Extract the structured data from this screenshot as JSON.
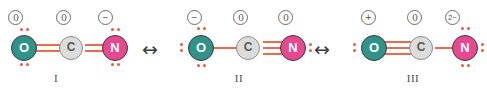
{
  "diagram": {
    "arrow_glyph": "↔",
    "structures": [
      {
        "label": "I",
        "atoms": [
          {
            "symbol": "O",
            "element": "oxygen",
            "formal_charge": "0"
          },
          {
            "symbol": "C",
            "element": "carbon",
            "formal_charge": "0"
          },
          {
            "symbol": "N",
            "element": "nitrogen",
            "formal_charge": "−"
          }
        ],
        "bonds": [
          {
            "from": "O",
            "to": "C",
            "order": 2
          },
          {
            "from": "C",
            "to": "N",
            "order": 2
          }
        ],
        "lone_pairs": {
          "O": 2,
          "C": 0,
          "N": 2
        }
      },
      {
        "label": "II",
        "atoms": [
          {
            "symbol": "O",
            "element": "oxygen",
            "formal_charge": "−"
          },
          {
            "symbol": "C",
            "element": "carbon",
            "formal_charge": "0"
          },
          {
            "symbol": "N",
            "element": "nitrogen",
            "formal_charge": "0"
          }
        ],
        "bonds": [
          {
            "from": "O",
            "to": "C",
            "order": 1
          },
          {
            "from": "C",
            "to": "N",
            "order": 3
          }
        ],
        "lone_pairs": {
          "O": 3,
          "C": 0,
          "N": 1
        }
      },
      {
        "label": "III",
        "atoms": [
          {
            "symbol": "O",
            "element": "oxygen",
            "formal_charge": "+"
          },
          {
            "symbol": "C",
            "element": "carbon",
            "formal_charge": "0"
          },
          {
            "symbol": "N",
            "element": "nitrogen",
            "formal_charge": "2−"
          }
        ],
        "bonds": [
          {
            "from": "O",
            "to": "C",
            "order": 3
          },
          {
            "from": "C",
            "to": "N",
            "order": 1
          }
        ],
        "lone_pairs": {
          "O": 1,
          "C": 0,
          "N": 3
        }
      }
    ],
    "colors": {
      "oxygen": "#2f9389",
      "carbon": "#dcdcdc",
      "nitrogen": "#e8488f",
      "bond": "#f06a4a",
      "lone_pair": "#f0563c",
      "background": "#ffffff"
    }
  }
}
